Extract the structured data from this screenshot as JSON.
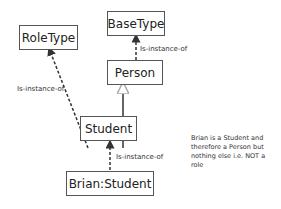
{
  "diagram": {
    "nodes": [
      {
        "id": "roletype",
        "label": "RoleType"
      },
      {
        "id": "basetype",
        "label": "BaseType"
      },
      {
        "id": "person",
        "label": "Person"
      },
      {
        "id": "student",
        "label": "Student"
      },
      {
        "id": "brian",
        "label": "Brian:Student"
      }
    ],
    "edges": [
      {
        "from": "person",
        "to": "basetype",
        "label": "Is-instance-of",
        "style": "dashed"
      },
      {
        "from": "student",
        "to": "roletype",
        "label": "Is-instance-of",
        "style": "dashed"
      },
      {
        "from": "student",
        "to": "person",
        "label": "",
        "style": "solid-generalization"
      },
      {
        "from": "brian",
        "to": "student",
        "label": "Is-instance-of",
        "style": "dashed"
      }
    ],
    "note": "Brian is a Student and therefore a Person but nothing else i.e. NOT a role"
  }
}
